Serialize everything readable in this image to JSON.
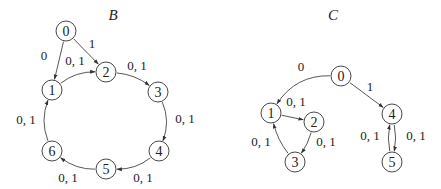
{
  "graphs": [
    {
      "id": "B",
      "title": "B",
      "nodes": [
        "0",
        "1",
        "2",
        "3",
        "4",
        "5",
        "6"
      ],
      "edges": [
        {
          "from": "0",
          "to": "1",
          "label": "0"
        },
        {
          "from": "0",
          "to": "2",
          "label": "1"
        },
        {
          "from": "1",
          "to": "2",
          "label": "0, 1"
        },
        {
          "from": "2",
          "to": "3",
          "label": "0, 1"
        },
        {
          "from": "3",
          "to": "4",
          "label": "0, 1"
        },
        {
          "from": "4",
          "to": "5",
          "label": "0, 1"
        },
        {
          "from": "5",
          "to": "6",
          "label": "0, 1"
        },
        {
          "from": "6",
          "to": "1",
          "label": "0, 1"
        }
      ]
    },
    {
      "id": "C",
      "title": "C",
      "nodes": [
        "0",
        "1",
        "2",
        "3",
        "4",
        "5"
      ],
      "edges": [
        {
          "from": "0",
          "to": "1",
          "label": "0"
        },
        {
          "from": "0",
          "to": "4",
          "label": "1"
        },
        {
          "from": "1",
          "to": "2",
          "label": "0, 1"
        },
        {
          "from": "2",
          "to": "3",
          "label": "0, 1"
        },
        {
          "from": "3",
          "to": "1",
          "label": "0, 1"
        },
        {
          "from": "4",
          "to": "5",
          "label": "0, 1"
        },
        {
          "from": "5",
          "to": "4",
          "label": "0, 1"
        }
      ]
    }
  ]
}
